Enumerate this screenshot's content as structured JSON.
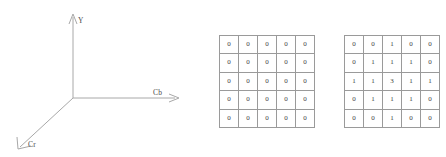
{
  "figure": {
    "axes_3d": {
      "name": "ycbcr-color-space-axes",
      "axis_labels": {
        "vertical": "Y",
        "horizontal": "Cb",
        "depth": "Cr"
      },
      "line_color": "#a8a8a8",
      "label_color": "#4a4a4a"
    },
    "matrices": [
      {
        "name": "zero-matrix",
        "rows": 5,
        "cols": 5,
        "values": [
          [
            "0",
            "0",
            "0",
            "0",
            "0"
          ],
          [
            "0",
            "0",
            "0",
            "0",
            "0"
          ],
          [
            "0",
            "0",
            "0",
            "0",
            "0"
          ],
          [
            "0",
            "0",
            "0",
            "0",
            "0"
          ],
          [
            "0",
            "0",
            "0",
            "0",
            "0"
          ]
        ]
      },
      {
        "name": "kernel-matrix",
        "rows": 5,
        "cols": 5,
        "values": [
          [
            "0",
            "0",
            "1",
            "0",
            "0"
          ],
          [
            "0",
            "1",
            "1",
            "1",
            "0"
          ],
          [
            "1",
            "1",
            "3",
            "1",
            "1"
          ],
          [
            "0",
            "1",
            "1",
            "1",
            "0"
          ],
          [
            "0",
            "0",
            "1",
            "0",
            "0"
          ]
        ]
      }
    ],
    "colors": {
      "background": "#ffffff",
      "grid_border": "#9a9a9a",
      "cell_text": "#3d3d3d"
    }
  }
}
